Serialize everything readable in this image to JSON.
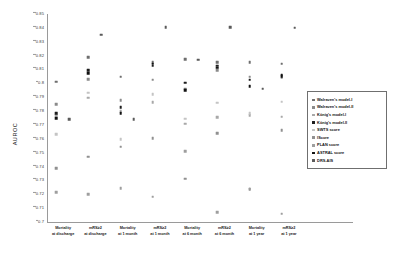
{
  "chart_data": {
    "type": "scatter",
    "title": "",
    "xlabel": "",
    "ylabel": "AUROC",
    "ylim": [
      0.7,
      0.85
    ],
    "ytick_step": 0.01,
    "grid": false,
    "legend_position": "right",
    "yticks": [
      "0.85",
      "0.84",
      "0.83",
      "0.82",
      "0.81",
      "0.8",
      "0.79",
      "0.78",
      "0.77",
      "0.76",
      "0.75",
      "0.74",
      "0.73",
      "0.72",
      "0.71",
      "0.7"
    ],
    "categories": [
      {
        "line1": "Mortality",
        "line2": "at discharge"
      },
      {
        "line1": "mRS≥2",
        "line2": "at discharge"
      },
      {
        "line1": "Mortality",
        "line2": "at 1 month"
      },
      {
        "line1": "mRS≥2",
        "line2": "at 1 month"
      },
      {
        "line1": "Mortality",
        "line2": "at 6 month"
      },
      {
        "line1": "mRS≥2",
        "line2": "at 6 month"
      },
      {
        "line1": "Mortality",
        "line2": "at 1 year"
      },
      {
        "line1": "mRS≥2",
        "line2": "at 1 year"
      }
    ],
    "series": [
      {
        "name": "Walraven's model-I",
        "color": "#6e6e6e",
        "marker": "square",
        "values": [
          0.8013,
          0.8187,
          0.8049,
          0.8154,
          0.8172,
          0.8154,
          0.8152,
          0.8141
        ]
      },
      {
        "name": "Walraven's model-II",
        "color": "#8a8a8a",
        "marker": "square",
        "values": [
          0.7849,
          0.8029,
          0.788,
          0.8025,
          0.7962,
          0.8094,
          0.8049,
          0.8045
        ]
      },
      {
        "name": "König's model-I",
        "color": "#a8a8a8",
        "marker": "square",
        "values": [
          0.777,
          0.7896,
          0.7798,
          0.7866,
          0.7708,
          0.7757,
          0.7772,
          0.7759
        ]
      },
      {
        "name": "König's model-II",
        "color": "#1c1c1c",
        "marker": "square",
        "values": [
          0.7785,
          0.8093,
          0.7829,
          0.8128,
          0.8005,
          0.8128,
          0.8026,
          0.8063
        ]
      },
      {
        "name": "SWTS score",
        "color": "#c4c4c4",
        "marker": "square",
        "values": [
          0.7633,
          0.7932,
          0.7598,
          0.7921,
          0.7744,
          0.7861,
          0.7783,
          0.7867
        ]
      },
      {
        "name": "IScore",
        "color": "#909090",
        "marker": "square",
        "values": [
          0.7386,
          0.7472,
          0.7543,
          0.7606,
          0.7312,
          0.764,
          0.7238,
          0.766
        ]
      },
      {
        "name": "PLAN score",
        "color": "#9e9e9e",
        "marker": "square",
        "values": [
          0.7216,
          0.72,
          0.7245,
          0.7182,
          0.751,
          0.707,
          0.724,
          0.706
        ]
      },
      {
        "name": "ASTRAL score",
        "color": "#111111",
        "marker": "square",
        "values": [
          0.775,
          0.8074,
          0.7783,
          0.8141,
          0.7952,
          0.8113,
          0.798,
          0.805
        ]
      },
      {
        "name": "DRS-AIS",
        "color": "#5a5a5a",
        "marker": "square",
        "values": [
          0.774,
          0.835,
          0.774,
          0.8405,
          0.817,
          0.8405,
          0.7962,
          0.84
        ]
      }
    ]
  }
}
